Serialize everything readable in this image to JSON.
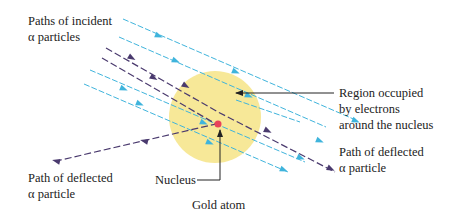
{
  "diagram": {
    "colors": {
      "atom_fill": "#f6e58d",
      "incident_path": "#3fb4dc",
      "deflected_path": "#4a3a6e",
      "nucleus": "#e8435a",
      "leader_line": "#222222"
    },
    "labels": {
      "incident": {
        "line1": "Paths of incident",
        "line2": "α particles"
      },
      "region": {
        "line1": "Region occupied",
        "line2": "by electrons",
        "line3": "around the nucleus"
      },
      "deflected_right": {
        "line1": "Path of deflected",
        "line2": "α particle"
      },
      "deflected_left": {
        "line1": "Path of deflected",
        "line2": "α particle"
      },
      "nucleus": "Nucleus",
      "atom": "Gold atom"
    }
  }
}
